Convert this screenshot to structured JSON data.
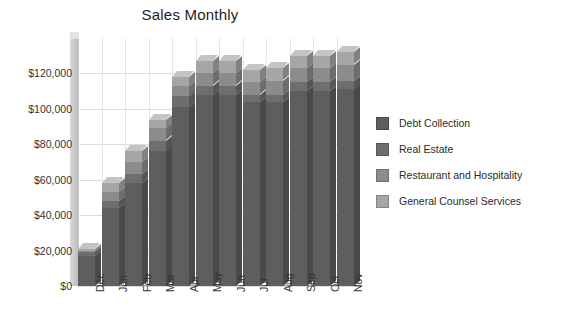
{
  "chart_data": {
    "type": "bar",
    "subtype": "stacked-column-3d",
    "title": "Sales Monthly",
    "xlabel": "",
    "ylabel": "",
    "ylim": [
      0,
      140000
    ],
    "grid": true,
    "legend_position": "right",
    "categories": [
      "Dec",
      "Jan",
      "Feb",
      "Mar",
      "Apr",
      "May",
      "Jun",
      "Jul",
      "Aug",
      "Sep",
      "Oct",
      "Nov"
    ],
    "ytick_labels": [
      "$0",
      "$20,000",
      "$40,000",
      "$60,000",
      "$80,000",
      "$100,000",
      "$120,000"
    ],
    "ytick_values": [
      0,
      20000,
      40000,
      60000,
      80000,
      100000,
      120000
    ],
    "series": [
      {
        "name": "Debt Collection",
        "color": "#5e5e5e",
        "values": [
          17000,
          44000,
          58000,
          76000,
          101000,
          108000,
          108000,
          104000,
          104000,
          110000,
          110000,
          111000
        ]
      },
      {
        "name": "Real Estate",
        "color": "#6e6e6e",
        "values": [
          2000,
          4000,
          5000,
          6000,
          6000,
          5000,
          5000,
          4000,
          4000,
          5000,
          5000,
          5000
        ]
      },
      {
        "name": "Restaurant and Hospitality",
        "color": "#8c8c8c",
        "values": [
          1000,
          5000,
          7000,
          7000,
          6000,
          7000,
          7000,
          7000,
          8000,
          8000,
          8000,
          9000
        ]
      },
      {
        "name": "General Counsel Services",
        "color": "#a6a6a6",
        "values": [
          1000,
          5000,
          6000,
          5000,
          5000,
          7000,
          7000,
          7000,
          7000,
          7000,
          7000,
          7000
        ]
      }
    ],
    "totals": [
      21000,
      58000,
      76000,
      94000,
      118000,
      127000,
      127000,
      122000,
      123000,
      130000,
      130000,
      132000
    ]
  },
  "legend": {
    "items": [
      {
        "label": "Debt Collection",
        "color": "#5e5e5e"
      },
      {
        "label": "Real Estate",
        "color": "#6e6e6e"
      },
      {
        "label": "Restaurant and Hospitality",
        "color": "#8c8c8c"
      },
      {
        "label": "General Counsel Services",
        "color": "#a6a6a6"
      }
    ]
  }
}
